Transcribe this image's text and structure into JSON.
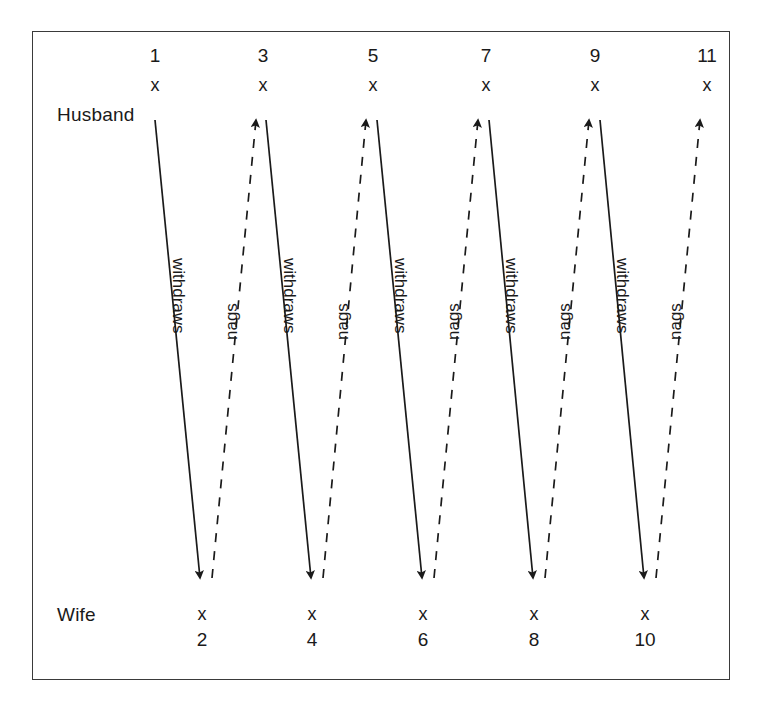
{
  "figure": {
    "role_labels": {
      "husband": "Husband",
      "wife": "Wife"
    },
    "marker_glyph": "x",
    "husband_nodes": [
      {
        "label": "1",
        "x": 155,
        "marker_x": 155
      },
      {
        "label": "3",
        "x": 263,
        "marker_x": 263
      },
      {
        "label": "5",
        "x": 373,
        "marker_x": 373
      },
      {
        "label": "7",
        "x": 486,
        "marker_x": 486
      },
      {
        "label": "9",
        "x": 595,
        "marker_x": 595
      },
      {
        "label": "11",
        "x": 707,
        "marker_x": 707
      }
    ],
    "wife_nodes": [
      {
        "label": "2",
        "x": 202
      },
      {
        "label": "4",
        "x": 312
      },
      {
        "label": "6",
        "x": 423
      },
      {
        "label": "8",
        "x": 534
      },
      {
        "label": "10",
        "x": 645
      }
    ],
    "edges": [
      {
        "label": "withdraws",
        "style": "solid",
        "direction": "down",
        "x1": 155,
        "y1": 120,
        "x2": 200,
        "y2": 578
      },
      {
        "label": "nags",
        "style": "dashed",
        "direction": "up",
        "x1": 212,
        "y1": 578,
        "x2": 256,
        "y2": 120
      },
      {
        "label": "withdraws",
        "style": "solid",
        "direction": "down",
        "x1": 266,
        "y1": 120,
        "x2": 311,
        "y2": 578
      },
      {
        "label": "nags",
        "style": "dashed",
        "direction": "up",
        "x1": 323,
        "y1": 578,
        "x2": 366,
        "y2": 120
      },
      {
        "label": "withdraws",
        "style": "solid",
        "direction": "down",
        "x1": 377,
        "y1": 120,
        "x2": 422,
        "y2": 578
      },
      {
        "label": "nags",
        "style": "dashed",
        "direction": "up",
        "x1": 434,
        "y1": 578,
        "x2": 478,
        "y2": 120
      },
      {
        "label": "withdraws",
        "style": "solid",
        "direction": "down",
        "x1": 489,
        "y1": 120,
        "x2": 533,
        "y2": 578
      },
      {
        "label": "nags",
        "style": "dashed",
        "direction": "up",
        "x1": 545,
        "y1": 578,
        "x2": 589,
        "y2": 120
      },
      {
        "label": "withdraws",
        "style": "solid",
        "direction": "down",
        "x1": 600,
        "y1": 120,
        "x2": 644,
        "y2": 578
      },
      {
        "label": "nags",
        "style": "dashed",
        "direction": "up",
        "x1": 656,
        "y1": 578,
        "x2": 700,
        "y2": 120
      }
    ],
    "label_positions": [
      {
        "text": "withdraws",
        "x": 188,
        "y": 258,
        "rotate": 90
      },
      {
        "text": "nags",
        "x": 222,
        "y": 340,
        "rotate": 270
      },
      {
        "text": "withdraws",
        "x": 299,
        "y": 258,
        "rotate": 90
      },
      {
        "text": "nags",
        "x": 333,
        "y": 340,
        "rotate": 270
      },
      {
        "text": "withdraws",
        "x": 410,
        "y": 258,
        "rotate": 90
      },
      {
        "text": "nags",
        "x": 444,
        "y": 340,
        "rotate": 270
      },
      {
        "text": "withdraws",
        "x": 521,
        "y": 258,
        "rotate": 90
      },
      {
        "text": "nags",
        "x": 555,
        "y": 340,
        "rotate": 270
      },
      {
        "text": "withdraws",
        "x": 632,
        "y": 258,
        "rotate": 90
      },
      {
        "text": "nags",
        "x": 666,
        "y": 340,
        "rotate": 270
      }
    ],
    "geometry": {
      "husband_row_num_y": 45,
      "husband_row_marker_y": 75,
      "husband_label_x": 57,
      "husband_label_y": 104,
      "wife_label_x": 57,
      "wife_label_y": 604,
      "wife_row_marker_y": 604,
      "wife_row_num_y": 629
    },
    "colors": {
      "line": "#1a1a1a",
      "frame": "#3a3a3a",
      "text": "#1a1a1a",
      "background": "#ffffff"
    }
  }
}
